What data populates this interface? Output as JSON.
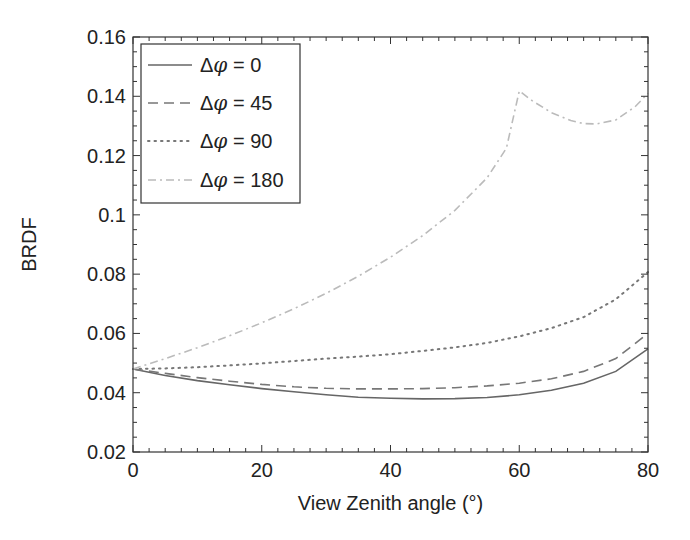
{
  "chart_data": {
    "type": "line",
    "title": "",
    "xlabel": "View Zenith angle (°)",
    "ylabel": "BRDF",
    "xlim": [
      0,
      80
    ],
    "ylim": [
      0.02,
      0.16
    ],
    "xticks": [
      0,
      20,
      40,
      60,
      80
    ],
    "xtick_labels": [
      "0",
      "20",
      "40",
      "60",
      "80"
    ],
    "yticks": [
      0.02,
      0.04,
      0.06,
      0.08,
      0.1,
      0.12,
      0.14,
      0.16
    ],
    "ytick_labels": [
      "0.02",
      "0.04",
      "0.06",
      "0.08",
      "0.1",
      "0.12",
      "0.14",
      "0.16"
    ],
    "grid": false,
    "legend_position": "top-left",
    "series": [
      {
        "name": "Δφ = 0",
        "legend_prefix": "Δ",
        "legend_symbol": "φ",
        "legend_suffix": " = 0",
        "style": "solid",
        "color": "#666666",
        "x": [
          0,
          5,
          10,
          15,
          20,
          25,
          30,
          35,
          40,
          45,
          50,
          55,
          60,
          65,
          70,
          75,
          80
        ],
        "y": [
          0.048,
          0.0458,
          0.0441,
          0.0427,
          0.0414,
          0.0403,
          0.0393,
          0.0385,
          0.0381,
          0.0379,
          0.038,
          0.0384,
          0.0393,
          0.0408,
          0.0432,
          0.0472,
          0.0548
        ]
      },
      {
        "name": "Δφ = 45",
        "legend_prefix": "Δ",
        "legend_symbol": "φ",
        "legend_suffix": " = 45",
        "style": "dashed",
        "color": "#777777",
        "x": [
          0,
          5,
          10,
          15,
          20,
          25,
          30,
          35,
          40,
          45,
          50,
          55,
          60,
          65,
          70,
          75,
          80
        ],
        "y": [
          0.048,
          0.0465,
          0.0451,
          0.0439,
          0.0428,
          0.042,
          0.0415,
          0.0413,
          0.0413,
          0.0414,
          0.0417,
          0.0423,
          0.0432,
          0.0447,
          0.0472,
          0.0515,
          0.06
        ]
      },
      {
        "name": "Δφ = 90",
        "legend_prefix": "Δ",
        "legend_symbol": "φ",
        "legend_suffix": " = 90",
        "style": "dotted",
        "color": "#777777",
        "x": [
          0,
          5,
          10,
          15,
          20,
          25,
          30,
          35,
          40,
          45,
          50,
          55,
          60,
          65,
          70,
          75,
          80
        ],
        "y": [
          0.048,
          0.0482,
          0.0486,
          0.0492,
          0.0499,
          0.0507,
          0.0515,
          0.0522,
          0.053,
          0.0541,
          0.0553,
          0.0568,
          0.059,
          0.0618,
          0.0655,
          0.0715,
          0.0807
        ]
      },
      {
        "name": "Δφ = 180",
        "legend_prefix": "Δ",
        "legend_symbol": "φ",
        "legend_suffix": " = 180",
        "style": "dashdot",
        "color": "#bbbbbb",
        "x": [
          0,
          5,
          10,
          15,
          20,
          25,
          30,
          35,
          40,
          45,
          50,
          55,
          58,
          60,
          62,
          65,
          68,
          70,
          72,
          75,
          78,
          80
        ],
        "y": [
          0.048,
          0.0515,
          0.0552,
          0.0592,
          0.0636,
          0.0683,
          0.0735,
          0.0793,
          0.0857,
          0.093,
          0.1015,
          0.1125,
          0.1225,
          0.1418,
          0.1385,
          0.1345,
          0.1318,
          0.1308,
          0.1307,
          0.132,
          0.1365,
          0.141
        ]
      }
    ]
  }
}
